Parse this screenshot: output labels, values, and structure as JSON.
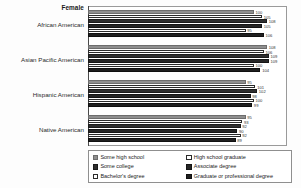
{
  "chart_data": {
    "type": "bar",
    "orientation": "horizontal",
    "title": "Female",
    "xlabel": "",
    "ylabel": "",
    "grid": false,
    "legend_position": "bottom",
    "xlim": [
      0,
      120
    ],
    "categories": [
      "African American",
      "Asian Pacific American",
      "Hispanic American",
      "Native American"
    ],
    "series": [
      {
        "name": "Some high school",
        "values": [
          100,
          108,
          95,
          95
        ]
      },
      {
        "name": "High school graduate",
        "values": [
          105,
          106,
          101,
          93
        ]
      },
      {
        "name": "Some college",
        "values": [
          108,
          109,
          102,
          92
        ]
      },
      {
        "name": "Associate degree",
        "values": [
          105,
          109,
          98,
          90
        ]
      },
      {
        "name": "Bachelor's degree",
        "values": [
          95,
          100,
          100,
          92
        ]
      },
      {
        "name": "Graduate or professional degree",
        "values": [
          106,
          104,
          99,
          89
        ]
      }
    ]
  },
  "legend": {
    "items": [
      "Some high school",
      "High school graduate",
      "Some college",
      "Associate degree",
      "Bachelor's degree",
      "Graduate or professional degree"
    ]
  }
}
